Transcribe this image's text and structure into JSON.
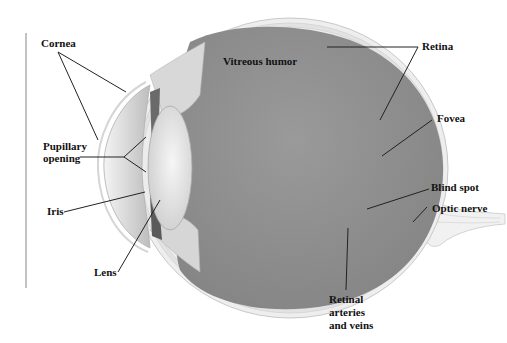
{
  "diagram": {
    "colors": {
      "vitreous": "#8f8f8f",
      "sclera": "#e4e4e4",
      "lens": "#e9e9e9",
      "leader_line": "#222222",
      "label_text": "#111111"
    },
    "labels": {
      "cornea": "Cornea",
      "pupillary_line1": "Pupillary",
      "pupillary_line2": "opening",
      "iris": "Iris",
      "lens": "Lens",
      "vitreous_humor": "Vitreous humor",
      "retina": "Retina",
      "fovea": "Fovea",
      "blind_spot": "Blind spot",
      "optic_nerve": "Optic nerve",
      "retinal_line1": "Retinal",
      "retinal_line2": "arteries",
      "retinal_line3": "and veins"
    }
  }
}
